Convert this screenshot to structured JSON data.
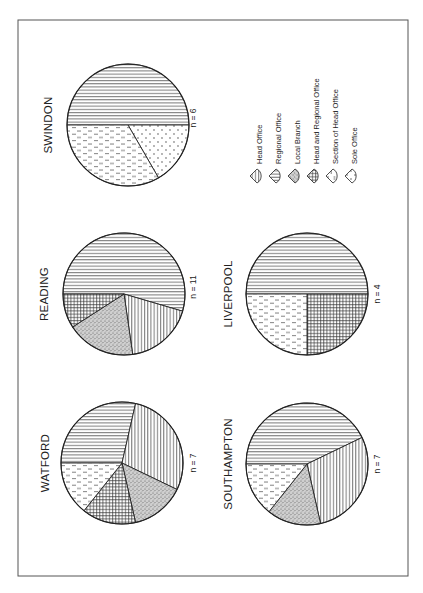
{
  "chart_data": {
    "type": "pie",
    "orientation": "page rotated 90° counter-clockwise (text reads bottom-to-top)",
    "legend": {
      "position": "right of Swindon pie (top-right in rotated frame)",
      "entries": [
        {
          "key": "head_office",
          "label": "Head Office",
          "pattern": "vertical-lines"
        },
        {
          "key": "regional_office",
          "label": "Regional Office",
          "pattern": "horizontal-lines"
        },
        {
          "key": "local_branch",
          "label": "Local Branch",
          "pattern": "stipple-dense"
        },
        {
          "key": "head_and_regional",
          "label": "Head and Regional Office",
          "pattern": "cross-hatch"
        },
        {
          "key": "section_of_head",
          "label": "Section of Head Office",
          "pattern": "dashed-vertical"
        },
        {
          "key": "sole_office",
          "label": "Sole Office",
          "pattern": "sparse-dots"
        }
      ]
    },
    "charts": [
      {
        "title": "SWINDON",
        "n_label": "n = 6",
        "n": 6,
        "slices": [
          {
            "category": "Head Office",
            "value": 3
          },
          {
            "category": "Sole Office",
            "value": 1
          },
          {
            "category": "Section of Head Office",
            "value": 2
          }
        ]
      },
      {
        "title": "READING",
        "n_label": "n = 11",
        "n": 11,
        "slices": [
          {
            "category": "Head Office",
            "value": 6
          },
          {
            "category": "Regional Office",
            "value": 2
          },
          {
            "category": "Local Branch",
            "value": 2
          },
          {
            "category": "Head and Regional Office",
            "value": 1
          }
        ]
      },
      {
        "title": "WATFORD",
        "n_label": "n = 7",
        "n": 7,
        "slices": [
          {
            "category": "Head Office",
            "value": 2
          },
          {
            "category": "Regional Office",
            "value": 2
          },
          {
            "category": "Local Branch",
            "value": 1
          },
          {
            "category": "Head and Regional Office",
            "value": 1
          },
          {
            "category": "Section of Head Office",
            "value": 1
          }
        ]
      },
      {
        "title": "LIVERPOOL",
        "n_label": "n = 4",
        "n": 4,
        "slices": [
          {
            "category": "Head Office",
            "value": 2
          },
          {
            "category": "Head and Regional Office",
            "value": 1
          },
          {
            "category": "Section of Head Office",
            "value": 1
          }
        ]
      },
      {
        "title": "SOUTHAMPTON",
        "n_label": "n = 7",
        "n": 7,
        "slices": [
          {
            "category": "Head Office",
            "value": 3
          },
          {
            "category": "Regional Office",
            "value": 2
          },
          {
            "category": "Local Branch",
            "value": 1
          },
          {
            "category": "Section of Head Office",
            "value": 1
          }
        ]
      }
    ]
  },
  "layout": {
    "frame": {
      "x": 18,
      "y": 20,
      "w": 390,
      "h": 556
    },
    "pies": [
      {
        "title_index": 0,
        "cx": 128,
        "cy": 125,
        "r": 61,
        "start_deg": 180,
        "title_x": 52,
        "title_y": 125,
        "n_x": 196,
        "n_y": 118
      },
      {
        "title_index": 1,
        "cx": 124,
        "cy": 294,
        "r": 61,
        "start_deg": 180,
        "title_x": 48,
        "title_y": 294,
        "n_x": 196,
        "n_y": 287
      },
      {
        "title_index": 2,
        "cx": 122,
        "cy": 463,
        "r": 61,
        "start_deg": 180,
        "title_x": 49,
        "title_y": 463,
        "n_x": 196,
        "n_y": 463
      },
      {
        "title_index": 3,
        "cx": 307,
        "cy": 294,
        "r": 61,
        "start_deg": 180,
        "title_x": 232,
        "title_y": 294,
        "n_x": 380,
        "n_y": 294
      },
      {
        "title_index": 4,
        "cx": 307,
        "cy": 464,
        "r": 61,
        "start_deg": 180,
        "title_x": 232,
        "title_y": 464,
        "n_x": 380,
        "n_y": 464
      }
    ],
    "legend_origin": {
      "x": 258,
      "y": 176,
      "dx": 19
    }
  }
}
